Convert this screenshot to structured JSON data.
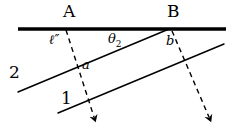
{
  "figure": {
    "background_color": "#ffffff",
    "ink_color": "#000000",
    "width": 232,
    "height": 130
  },
  "labels": {
    "point_a": "A",
    "point_b": "B",
    "ell_prime": "ℓ″",
    "theta_symbol": "θ",
    "theta_subscript": "2",
    "angle_b": "b",
    "angle_a": "a",
    "line_two": "2",
    "line_one": "1"
  },
  "geometry": {
    "thick_line": {
      "name": "thick-horizontal-line",
      "x1": 18,
      "y1": 29,
      "x2": 226,
      "y2": 29,
      "stroke_width": 3.6,
      "color": "#000000",
      "dashed": false
    },
    "line_two": {
      "name": "solid-line-2",
      "x1": 18,
      "y1": 92,
      "x2": 169,
      "y2": 29,
      "stroke_width": 1.5,
      "color": "#000000",
      "dashed": false
    },
    "line_one": {
      "name": "solid-line-1",
      "x1": 58,
      "y1": 113,
      "x2": 224,
      "y2": 44,
      "stroke_width": 1.5,
      "color": "#000000",
      "dashed": false
    },
    "dashed_left": {
      "name": "dashed-ray-from-a",
      "x1": 66,
      "y1": 30,
      "x2": 94,
      "y2": 117,
      "stroke_width": 1.4,
      "color": "#000000",
      "dashed": true,
      "dash_pattern": "5,4",
      "arrow": true
    },
    "dashed_right": {
      "name": "dashed-ray-from-b",
      "x1": 172,
      "y1": 31,
      "x2": 209,
      "y2": 117,
      "stroke_width": 1.4,
      "color": "#000000",
      "dashed": true,
      "dash_pattern": "5,4",
      "arrow": true
    },
    "point_a_marker": {
      "x": 66,
      "y": 29
    },
    "point_b_marker": {
      "x": 172,
      "y": 29
    }
  }
}
